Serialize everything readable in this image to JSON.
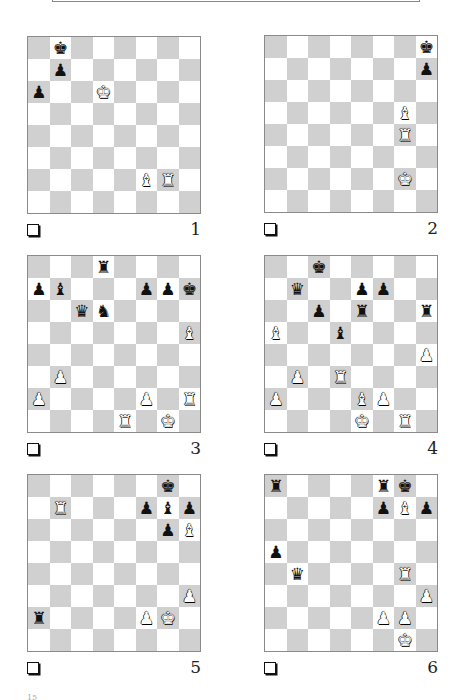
{
  "page": {
    "footer_mark": "15"
  },
  "diagrams": [
    {
      "number": "1",
      "pieces": [
        {
          "square": "b8",
          "type": "king",
          "color": "black"
        },
        {
          "square": "b7",
          "type": "pawn",
          "color": "black"
        },
        {
          "square": "a6",
          "type": "pawn",
          "color": "black"
        },
        {
          "square": "d6",
          "type": "king",
          "color": "white"
        },
        {
          "square": "f2",
          "type": "bishop",
          "color": "white"
        },
        {
          "square": "g2",
          "type": "rook",
          "color": "white"
        }
      ]
    },
    {
      "number": "2",
      "pieces": [
        {
          "square": "h8",
          "type": "king",
          "color": "black"
        },
        {
          "square": "h7",
          "type": "pawn",
          "color": "black"
        },
        {
          "square": "g5",
          "type": "bishop",
          "color": "white"
        },
        {
          "square": "g4",
          "type": "rook",
          "color": "white"
        },
        {
          "square": "g2",
          "type": "king",
          "color": "white"
        }
      ]
    },
    {
      "number": "3",
      "pieces": [
        {
          "square": "d8",
          "type": "rook",
          "color": "black"
        },
        {
          "square": "a7",
          "type": "pawn",
          "color": "black"
        },
        {
          "square": "b7",
          "type": "bishop",
          "color": "black"
        },
        {
          "square": "f7",
          "type": "pawn",
          "color": "black"
        },
        {
          "square": "g7",
          "type": "pawn",
          "color": "black"
        },
        {
          "square": "h7",
          "type": "king",
          "color": "black"
        },
        {
          "square": "c6",
          "type": "queen",
          "color": "black"
        },
        {
          "square": "d6",
          "type": "knight",
          "color": "black"
        },
        {
          "square": "h5",
          "type": "bishop",
          "color": "white"
        },
        {
          "square": "b3",
          "type": "pawn",
          "color": "white"
        },
        {
          "square": "a2",
          "type": "pawn",
          "color": "white"
        },
        {
          "square": "f2",
          "type": "pawn",
          "color": "white"
        },
        {
          "square": "h2",
          "type": "rook",
          "color": "white"
        },
        {
          "square": "e1",
          "type": "rook",
          "color": "white"
        },
        {
          "square": "g1",
          "type": "king",
          "color": "white"
        }
      ]
    },
    {
      "number": "4",
      "pieces": [
        {
          "square": "c8",
          "type": "king",
          "color": "black"
        },
        {
          "square": "b7",
          "type": "queen",
          "color": "black"
        },
        {
          "square": "e7",
          "type": "pawn",
          "color": "black"
        },
        {
          "square": "f7",
          "type": "pawn",
          "color": "black"
        },
        {
          "square": "c6",
          "type": "pawn",
          "color": "black"
        },
        {
          "square": "e6",
          "type": "rook",
          "color": "black"
        },
        {
          "square": "h6",
          "type": "rook",
          "color": "black"
        },
        {
          "square": "a5",
          "type": "bishop",
          "color": "white"
        },
        {
          "square": "d5",
          "type": "bishop",
          "color": "black"
        },
        {
          "square": "h4",
          "type": "pawn",
          "color": "white"
        },
        {
          "square": "b3",
          "type": "pawn",
          "color": "white"
        },
        {
          "square": "d3",
          "type": "rook",
          "color": "white"
        },
        {
          "square": "a2",
          "type": "pawn",
          "color": "white"
        },
        {
          "square": "e2",
          "type": "bishop",
          "color": "white"
        },
        {
          "square": "f2",
          "type": "pawn",
          "color": "white"
        },
        {
          "square": "e1",
          "type": "king",
          "color": "white"
        },
        {
          "square": "g1",
          "type": "rook",
          "color": "white"
        }
      ]
    },
    {
      "number": "5",
      "pieces": [
        {
          "square": "g8",
          "type": "king",
          "color": "black"
        },
        {
          "square": "b7",
          "type": "rook",
          "color": "white"
        },
        {
          "square": "f7",
          "type": "pawn",
          "color": "black"
        },
        {
          "square": "g7",
          "type": "bishop",
          "color": "black"
        },
        {
          "square": "h7",
          "type": "pawn",
          "color": "black"
        },
        {
          "square": "g6",
          "type": "pawn",
          "color": "black"
        },
        {
          "square": "h6",
          "type": "bishop",
          "color": "white"
        },
        {
          "square": "h3",
          "type": "pawn",
          "color": "white"
        },
        {
          "square": "a2",
          "type": "rook",
          "color": "black"
        },
        {
          "square": "f2",
          "type": "pawn",
          "color": "white"
        },
        {
          "square": "g2",
          "type": "king",
          "color": "white"
        }
      ]
    },
    {
      "number": "6",
      "pieces": [
        {
          "square": "a8",
          "type": "rook",
          "color": "black"
        },
        {
          "square": "f8",
          "type": "rook",
          "color": "black"
        },
        {
          "square": "g8",
          "type": "king",
          "color": "black"
        },
        {
          "square": "f7",
          "type": "pawn",
          "color": "black"
        },
        {
          "square": "g7",
          "type": "bishop",
          "color": "white"
        },
        {
          "square": "h7",
          "type": "pawn",
          "color": "black"
        },
        {
          "square": "a5",
          "type": "pawn",
          "color": "black"
        },
        {
          "square": "b4",
          "type": "queen",
          "color": "black"
        },
        {
          "square": "g4",
          "type": "rook",
          "color": "white"
        },
        {
          "square": "h3",
          "type": "pawn",
          "color": "white"
        },
        {
          "square": "f2",
          "type": "pawn",
          "color": "white"
        },
        {
          "square": "g2",
          "type": "pawn",
          "color": "white"
        },
        {
          "square": "g1",
          "type": "king",
          "color": "white"
        }
      ]
    }
  ]
}
